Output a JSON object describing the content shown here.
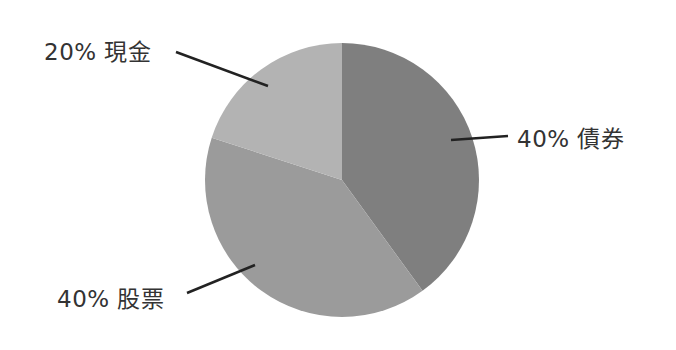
{
  "chart_data": {
    "type": "pie",
    "title": "",
    "start_angle_deg": 0,
    "direction": "clockwise",
    "slices": [
      {
        "label": "債券",
        "value": 40,
        "display": "40% 債券",
        "color": "#7f7f7f"
      },
      {
        "label": "股票",
        "value": 40,
        "display": "40% 股票",
        "color": "#9b9b9b"
      },
      {
        "label": "現金",
        "value": 20,
        "display": "20% 現金",
        "color": "#b3b3b3"
      }
    ],
    "legend": "none",
    "labels_with_leader_lines": true
  },
  "labels": {
    "bonds": "40% 債券",
    "stocks": "40% 股票",
    "cash": "20% 現金"
  }
}
